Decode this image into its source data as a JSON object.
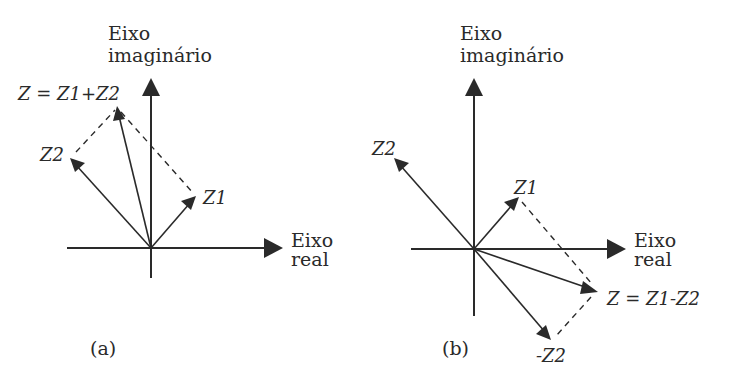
{
  "colors": {
    "ink": "#2a2a2a",
    "background": "#ffffff"
  },
  "panels": [
    {
      "id": "a",
      "caption": "(a)",
      "operation": "addition",
      "axes": {
        "imaginary_label_line1": "Eixo",
        "imaginary_label_line2": "imaginário",
        "real_label_line1": "Eixo",
        "real_label_line2": "real"
      },
      "vectors": [
        {
          "name": "Z1",
          "label": "Z1"
        },
        {
          "name": "Z2",
          "label": "Z2"
        },
        {
          "name": "Z",
          "label": "Z = Z1+Z2"
        }
      ]
    },
    {
      "id": "b",
      "caption": "(b)",
      "operation": "subtraction",
      "axes": {
        "imaginary_label_line1": "Eixo",
        "imaginary_label_line2": "imaginário",
        "real_label_line1": "Eixo",
        "real_label_line2": "real"
      },
      "vectors": [
        {
          "name": "Z1",
          "label": "Z1"
        },
        {
          "name": "Z2",
          "label": "Z2"
        },
        {
          "name": "-Z2",
          "label": "-Z2"
        },
        {
          "name": "Z",
          "label": "Z = Z1-Z2"
        }
      ]
    }
  ]
}
